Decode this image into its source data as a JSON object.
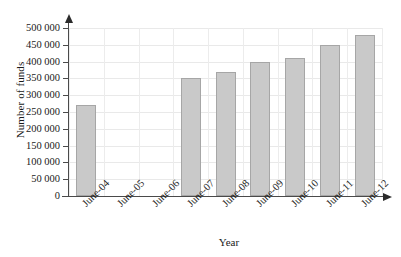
{
  "chart_data": {
    "type": "bar",
    "title": "",
    "xlabel": "Year",
    "ylabel": "Number of funds",
    "categories": [
      "June-04",
      "June-05",
      "June-06",
      "June-07",
      "June-08",
      "June-09",
      "June-10",
      "June-11",
      "June-12"
    ],
    "values": [
      270000,
      null,
      null,
      350000,
      370000,
      400000,
      410000,
      450000,
      480000
    ],
    "ylim": [
      0,
      500000
    ],
    "ytick_values": [
      0,
      50000,
      100000,
      150000,
      200000,
      250000,
      300000,
      350000,
      400000,
      450000,
      500000
    ],
    "ytick_labels": [
      "0",
      "50 000",
      "100 000",
      "150 000",
      "200 000",
      "250 000",
      "300 000",
      "350 000",
      "400 000",
      "450 000",
      "500 000"
    ],
    "grid": true,
    "legend": "none",
    "bar_color": "#c9c9c9",
    "bar_border_color": "#a6a6a6",
    "axis_color": "#4a4a4a",
    "grid_color": "#e9e9e9"
  }
}
